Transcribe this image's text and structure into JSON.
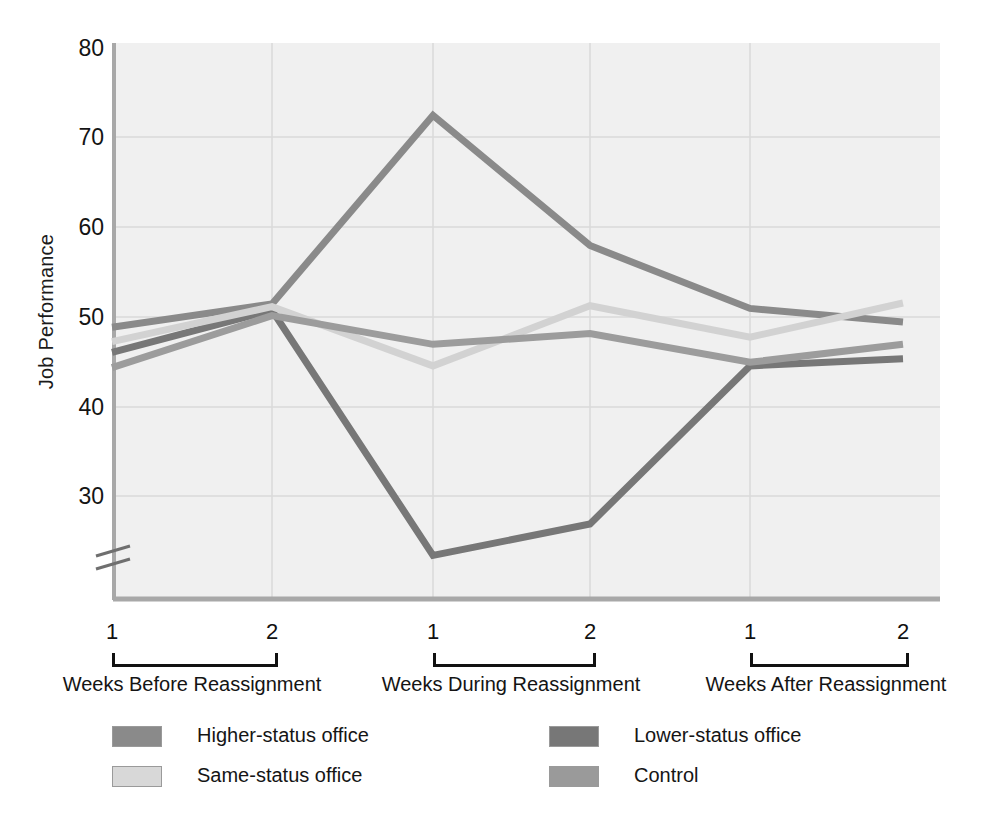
{
  "chart_data": {
    "type": "line",
    "title": "",
    "xlabel": "",
    "ylabel": "Job Performance",
    "ylim": [
      23,
      80
    ],
    "yticks": [
      30,
      40,
      50,
      60,
      70,
      80
    ],
    "axis_break": true,
    "grid": true,
    "legend_position": "bottom",
    "x": [
      "1",
      "2",
      "1",
      "2",
      "1",
      "2"
    ],
    "x_groups": [
      {
        "label": "Weeks Before Reassignment",
        "ticks": [
          "1",
          "2"
        ]
      },
      {
        "label": "Weeks During Reassignment",
        "ticks": [
          "1",
          "2"
        ]
      },
      {
        "label": "Weeks After Reassignment",
        "ticks": [
          "1",
          "2"
        ]
      }
    ],
    "series": [
      {
        "name": "Higher-status office",
        "color": "#8a8a8a",
        "values": [
          48.9,
          51.5,
          72.5,
          58.0,
          51.0,
          49.5
        ]
      },
      {
        "name": "Lower-status office",
        "color": "#777777",
        "values": [
          46.1,
          50.8,
          23.5,
          27.0,
          44.6,
          45.4
        ]
      },
      {
        "name": "Same-status office",
        "color": "#d2d2d2",
        "values": [
          47.3,
          51.2,
          44.6,
          51.3,
          47.8,
          51.6
        ]
      },
      {
        "name": "Control",
        "color": "#9c9c9c",
        "values": [
          44.4,
          50.2,
          47.0,
          48.2,
          45.0,
          47.0
        ]
      }
    ]
  },
  "legend": {
    "entries": [
      {
        "label": "Higher-status office",
        "color": "#8a8a8a"
      },
      {
        "label": "Lower-status office",
        "color": "#777777"
      },
      {
        "label": "Same-status office",
        "color": "#d8d8d8"
      },
      {
        "label": "Control",
        "color": "#9a9a9a"
      }
    ]
  },
  "axes": {
    "y_title": "Job Performance",
    "y_ticks": [
      "80",
      "70",
      "60",
      "50",
      "40",
      "30"
    ]
  },
  "colors": {
    "plot_background": "#f0f0f0",
    "gridline": "#dcdcdc",
    "axis": "#a6a6a6",
    "text": "#151515"
  }
}
